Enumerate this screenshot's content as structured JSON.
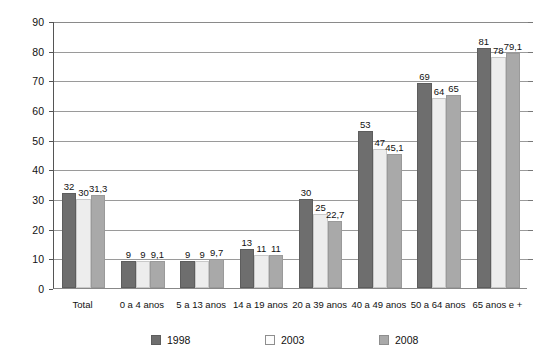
{
  "chart_data": {
    "type": "bar",
    "title": "",
    "subtitle": "",
    "xlabel": "",
    "ylabel": "",
    "ylim": [
      0,
      90
    ],
    "ytick_step": 10,
    "yticks": [
      "0",
      "10",
      "20",
      "30",
      "40",
      "50",
      "60",
      "70",
      "80",
      "90"
    ],
    "grid": true,
    "legend_position": "bottom",
    "categories": [
      "Total",
      "0 a 4 anos",
      "5 a 13 anos",
      "14 a 19 anos",
      "20 a 39 anos",
      "40 a 49 anos",
      "50 a 64 anos",
      "65 anos e +"
    ],
    "series": [
      {
        "name": "1998",
        "color": "#6e6e6e",
        "values": [
          32,
          9,
          9,
          13,
          30,
          53,
          69,
          81
        ],
        "labels": [
          "32",
          "9",
          "9",
          "13",
          "30",
          "53",
          "69",
          "81"
        ]
      },
      {
        "name": "2003",
        "color": "#ededed",
        "values": [
          30,
          9,
          9,
          11,
          25,
          47,
          64,
          78
        ],
        "labels": [
          "30",
          "9",
          "9",
          "11",
          "25",
          "47",
          "64",
          "78"
        ]
      },
      {
        "name": "2008",
        "color": "#a9a9a9",
        "values": [
          31.3,
          9.1,
          9.7,
          11,
          22.7,
          45.1,
          65,
          79.1
        ],
        "labels": [
          "31,3",
          "9,1",
          "9,7",
          "11",
          "22,7",
          "45,1",
          "65",
          "79,1"
        ]
      }
    ]
  },
  "legend": {
    "items": [
      {
        "label": "1998",
        "swatch": "legend-swatch-1998"
      },
      {
        "label": "2003",
        "swatch": "legend-swatch-2003"
      },
      {
        "label": "2008",
        "swatch": "legend-swatch-2008"
      }
    ]
  }
}
